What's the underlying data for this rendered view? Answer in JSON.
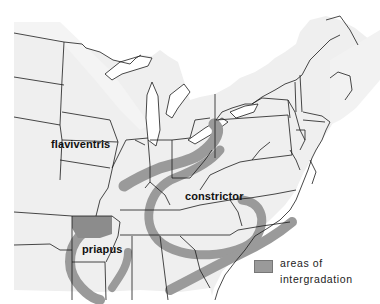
{
  "map": {
    "title": "",
    "region": "Eastern United States and southeastern Canada",
    "labels": {
      "flaviventris": "flaviventris",
      "constrictor": "constrictor",
      "priapus": "priapus"
    },
    "legend": {
      "line1": "areas of",
      "line2": "intergradation",
      "swatch_color": "#9a9a9a"
    },
    "colors": {
      "land": "#efefef",
      "water": "#ffffff",
      "borders": "#1a1a1a",
      "intergradation": "#9a9a9a"
    }
  }
}
